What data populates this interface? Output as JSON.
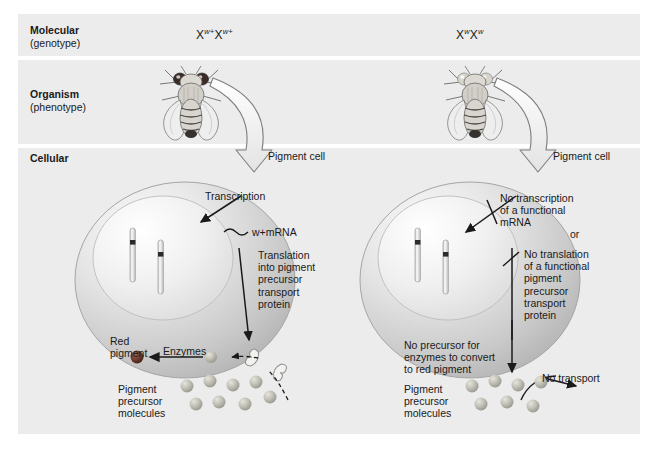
{
  "figure": {
    "bands": [
      {
        "id": "molecular",
        "label_bold": "Molecular",
        "label_sub": "(genotype)"
      },
      {
        "id": "organism",
        "label_bold": "Organism",
        "label_sub": "(phenotype)"
      },
      {
        "id": "cellular",
        "label_bold": "Cellular",
        "label_sub": ""
      }
    ],
    "colors": {
      "band_bg": "#ececec",
      "page_bg": "#ffffff",
      "text": "#1a1a1a",
      "cell_fill": "#d9d9d9",
      "nucleus_fill": "#e8e8e8",
      "precursor_molecule": "#b5b5ad",
      "red_pigment": "#6d3b2e",
      "chromosome": "#d6d6d6",
      "chromosome_band": "#2b2b2b",
      "arrow_outline": "#4a4a4a"
    }
  },
  "left_column": {
    "genotype_x1": "X",
    "genotype_sup1": "w+",
    "genotype_x2": "X",
    "genotype_sup2": "w+",
    "fly_eye_color": "#3a2b26",
    "fly_eye_label": "red eyes",
    "pigment_cell_label": "Pigment cell",
    "chromosome_labels": [
      "w+",
      "w+"
    ],
    "transcription_label": "Transcription",
    "mrna_italic": "w+",
    "mrna_label": "mRNA",
    "translation_label": "Translation\ninto pigment\nprecursor\ntransport\nprotein",
    "red_pigment_label": "Red\npigment",
    "enzymes_label": "Enzymes",
    "precursor_label": "Pigment\nprecursor\nmolecules",
    "precursor_count": 8
  },
  "right_column": {
    "genotype_x1": "X",
    "genotype_sup1": "w",
    "genotype_x2": "X",
    "genotype_sup2": "w",
    "fly_eye_color": "#d8d4cc",
    "fly_eye_label": "white eyes",
    "pigment_cell_label": "Pigment cell",
    "chromosome_labels": [
      "w",
      "w"
    ],
    "no_transcription_label": "No transcription\nof a functional\nmRNA",
    "or_label": "or",
    "no_translation_label": "No translation\nof a functional\npigment\nprecursor\ntransport\nprotein",
    "no_precursor_label": "No precursor for\nenzymes to convert\nto red pigment",
    "no_transport_label": "No transport",
    "precursor_label": "Pigment\nprecursor\nmolecules",
    "precursor_count": 7
  }
}
